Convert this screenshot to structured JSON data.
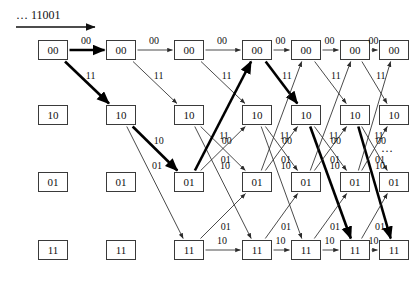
{
  "figure": {
    "type": "trellis-diagram",
    "input_label": "… 11001",
    "tail_ellipsis": "…",
    "colors": {
      "box_border": "#3a3a3a",
      "edge": "#2b2b2b",
      "survivor_path": "#000000",
      "background": "#ffffff"
    }
  },
  "states": [
    "00",
    "10",
    "01",
    "11"
  ],
  "columns": 7,
  "geometry": {
    "col_x": [
      38,
      106,
      174,
      242,
      291,
      340,
      379
    ],
    "row_y": [
      40,
      105,
      172,
      240
    ],
    "box_w": 30,
    "box_h": 20
  },
  "nodes": [
    {
      "state": "00",
      "col": 0,
      "label": "00"
    },
    {
      "state": "00",
      "col": 1,
      "label": "00"
    },
    {
      "state": "00",
      "col": 2,
      "label": "00"
    },
    {
      "state": "00",
      "col": 3,
      "label": "00"
    },
    {
      "state": "00",
      "col": 4,
      "label": "00"
    },
    {
      "state": "00",
      "col": 5,
      "label": "00"
    },
    {
      "state": "00",
      "col": 6,
      "label": "00"
    },
    {
      "state": "10",
      "col": 0,
      "label": "10"
    },
    {
      "state": "10",
      "col": 1,
      "label": "10"
    },
    {
      "state": "10",
      "col": 2,
      "label": "10"
    },
    {
      "state": "10",
      "col": 3,
      "label": "10"
    },
    {
      "state": "10",
      "col": 4,
      "label": "10"
    },
    {
      "state": "10",
      "col": 5,
      "label": "10"
    },
    {
      "state": "10",
      "col": 6,
      "label": "10"
    },
    {
      "state": "01",
      "col": 0,
      "label": "01"
    },
    {
      "state": "01",
      "col": 1,
      "label": "01"
    },
    {
      "state": "01",
      "col": 2,
      "label": "01"
    },
    {
      "state": "01",
      "col": 3,
      "label": "01"
    },
    {
      "state": "01",
      "col": 4,
      "label": "01"
    },
    {
      "state": "01",
      "col": 5,
      "label": "01"
    },
    {
      "state": "01",
      "col": 6,
      "label": "01"
    },
    {
      "state": "11",
      "col": 0,
      "label": "11"
    },
    {
      "state": "11",
      "col": 1,
      "label": "11"
    },
    {
      "state": "11",
      "col": 2,
      "label": "11"
    },
    {
      "state": "11",
      "col": 3,
      "label": "11"
    },
    {
      "state": "11",
      "col": 4,
      "label": "11"
    },
    {
      "state": "11",
      "col": 5,
      "label": "11"
    },
    {
      "state": "11",
      "col": 6,
      "label": "11"
    }
  ],
  "edges": [
    {
      "from_col": 0,
      "from_row": 0,
      "to_col": 1,
      "to_row": 0,
      "label": "00",
      "survivor": true
    },
    {
      "from_col": 0,
      "from_row": 0,
      "to_col": 1,
      "to_row": 1,
      "label": "11",
      "survivor": true
    },
    {
      "from_col": 1,
      "from_row": 0,
      "to_col": 2,
      "to_row": 0,
      "label": "00",
      "survivor": false
    },
    {
      "from_col": 1,
      "from_row": 0,
      "to_col": 2,
      "to_row": 1,
      "label": "11",
      "survivor": false
    },
    {
      "from_col": 1,
      "from_row": 1,
      "to_col": 2,
      "to_row": 2,
      "label": "10",
      "survivor": true
    },
    {
      "from_col": 1,
      "from_row": 1,
      "to_col": 2,
      "to_row": 3,
      "label": "01",
      "survivor": false
    },
    {
      "from_col": 2,
      "from_row": 0,
      "to_col": 3,
      "to_row": 0,
      "label": "00",
      "survivor": false
    },
    {
      "from_col": 2,
      "from_row": 0,
      "to_col": 3,
      "to_row": 1,
      "label": "11",
      "survivor": false
    },
    {
      "from_col": 2,
      "from_row": 1,
      "to_col": 3,
      "to_row": 2,
      "label": "00",
      "survivor": false
    },
    {
      "from_col": 2,
      "from_row": 1,
      "to_col": 3,
      "to_row": 3,
      "label": "10",
      "survivor": false
    },
    {
      "from_col": 2,
      "from_row": 2,
      "to_col": 3,
      "to_row": 0,
      "label": "11",
      "survivor": true
    },
    {
      "from_col": 2,
      "from_row": 2,
      "to_col": 3,
      "to_row": 1,
      "label": "01",
      "survivor": false
    },
    {
      "from_col": 2,
      "from_row": 3,
      "to_col": 3,
      "to_row": 2,
      "label": "01",
      "survivor": false
    },
    {
      "from_col": 2,
      "from_row": 3,
      "to_col": 3,
      "to_row": 3,
      "label": "10",
      "survivor": false
    },
    {
      "from_col": 3,
      "from_row": 0,
      "to_col": 4,
      "to_row": 0,
      "label": "00",
      "survivor": false
    },
    {
      "from_col": 3,
      "from_row": 0,
      "to_col": 4,
      "to_row": 1,
      "label": "11",
      "survivor": true
    },
    {
      "from_col": 3,
      "from_row": 1,
      "to_col": 4,
      "to_row": 2,
      "label": "00",
      "survivor": false
    },
    {
      "from_col": 3,
      "from_row": 1,
      "to_col": 4,
      "to_row": 3,
      "label": "10",
      "survivor": false
    },
    {
      "from_col": 3,
      "from_row": 2,
      "to_col": 4,
      "to_row": 0,
      "label": "11",
      "survivor": false
    },
    {
      "from_col": 3,
      "from_row": 2,
      "to_col": 4,
      "to_row": 1,
      "label": "01",
      "survivor": false
    },
    {
      "from_col": 3,
      "from_row": 3,
      "to_col": 4,
      "to_row": 2,
      "label": "01",
      "survivor": false
    },
    {
      "from_col": 3,
      "from_row": 3,
      "to_col": 4,
      "to_row": 3,
      "label": "10",
      "survivor": false
    },
    {
      "from_col": 4,
      "from_row": 0,
      "to_col": 5,
      "to_row": 0,
      "label": "00",
      "survivor": false
    },
    {
      "from_col": 4,
      "from_row": 0,
      "to_col": 5,
      "to_row": 1,
      "label": "11",
      "survivor": false
    },
    {
      "from_col": 4,
      "from_row": 1,
      "to_col": 5,
      "to_row": 2,
      "label": "00",
      "survivor": false
    },
    {
      "from_col": 4,
      "from_row": 1,
      "to_col": 5,
      "to_row": 3,
      "label": "10",
      "survivor": true
    },
    {
      "from_col": 4,
      "from_row": 2,
      "to_col": 5,
      "to_row": 0,
      "label": "11",
      "survivor": false
    },
    {
      "from_col": 4,
      "from_row": 2,
      "to_col": 5,
      "to_row": 1,
      "label": "01",
      "survivor": false
    },
    {
      "from_col": 4,
      "from_row": 3,
      "to_col": 5,
      "to_row": 2,
      "label": "01",
      "survivor": false
    },
    {
      "from_col": 4,
      "from_row": 3,
      "to_col": 5,
      "to_row": 3,
      "label": "10",
      "survivor": false
    },
    {
      "from_col": 5,
      "from_row": 0,
      "to_col": 6,
      "to_row": 0,
      "label": "00",
      "survivor": false
    },
    {
      "from_col": 5,
      "from_row": 0,
      "to_col": 6,
      "to_row": 1,
      "label": "11",
      "survivor": false
    },
    {
      "from_col": 5,
      "from_row": 1,
      "to_col": 6,
      "to_row": 2,
      "label": "00",
      "survivor": false
    },
    {
      "from_col": 5,
      "from_row": 1,
      "to_col": 6,
      "to_row": 3,
      "label": "10",
      "survivor": true
    },
    {
      "from_col": 5,
      "from_row": 2,
      "to_col": 6,
      "to_row": 0,
      "label": "11",
      "survivor": false
    },
    {
      "from_col": 5,
      "from_row": 2,
      "to_col": 6,
      "to_row": 1,
      "label": "01",
      "survivor": false
    },
    {
      "from_col": 5,
      "from_row": 3,
      "to_col": 6,
      "to_row": 2,
      "label": "01",
      "survivor": false
    },
    {
      "from_col": 5,
      "from_row": 3,
      "to_col": 6,
      "to_row": 3,
      "label": "10",
      "survivor": false
    }
  ]
}
